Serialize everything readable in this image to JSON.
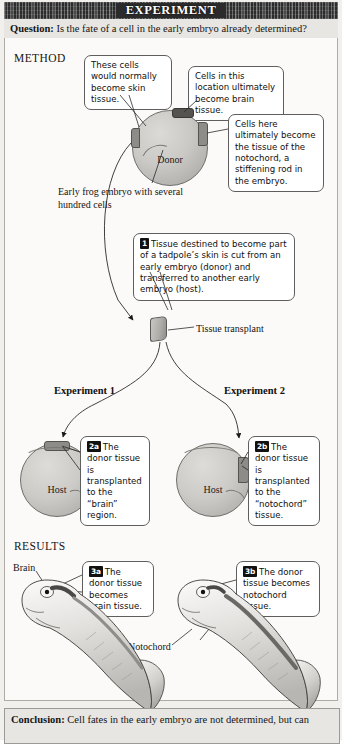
{
  "header": {
    "title": "EXPERIMENT",
    "question_label": "Question:",
    "question_text": " Is the fate of a cell in the early embryo already determined?"
  },
  "conclusion": {
    "label": "Conclusion:",
    "text": " Cell fates in the early embryo are not determined, but can"
  },
  "sections": {
    "method": "METHOD",
    "results": "RESULTS"
  },
  "method": {
    "callouts": [
      {
        "id": "skin",
        "text": "These cells would normally become skin tissue."
      },
      {
        "id": "brain",
        "text": "Cells in this location ultimately become brain tissue."
      },
      {
        "id": "notochord",
        "text": "Cells here ultimately become the tissue of the notochord, a stiffening rod in the embryo."
      }
    ],
    "donor_label": "Donor",
    "embryo_caption": "Early frog embryo with several hundred cells",
    "step1": {
      "badge": "1",
      "text": "Tissue destined to become part of a tadpole’s skin is cut from an early embryo (donor) and transferred to another early embryo (host)."
    },
    "transplant_label": "Tissue transplant"
  },
  "experiments": [
    {
      "title": "Experiment 1",
      "host_label": "Host",
      "step": {
        "badge": "2a",
        "text": "The donor tissue is transplanted to the “brain” region."
      }
    },
    {
      "title": "Experiment 2",
      "host_label": "Host",
      "step": {
        "badge": "2b",
        "text": "The donor tissue is transplanted to the “notochord” tissue."
      }
    }
  ],
  "results": [
    {
      "step": {
        "badge": "3a",
        "text": "The donor tissue becomes brain tissue."
      },
      "anatomy_label": "Brain"
    },
    {
      "step": {
        "badge": "3b",
        "text": "The donor tissue becomes notochord tissue."
      },
      "anatomy_label": "Notochord"
    }
  ],
  "colors": {
    "header_bg": "#2b2b2b",
    "bar_bg": "#e8e6e2",
    "embryo_fill": "#cbc9c5",
    "tissue_patch": "#8e8c88",
    "brain_patch": "#55534f",
    "outline": "#5e5e5e"
  }
}
